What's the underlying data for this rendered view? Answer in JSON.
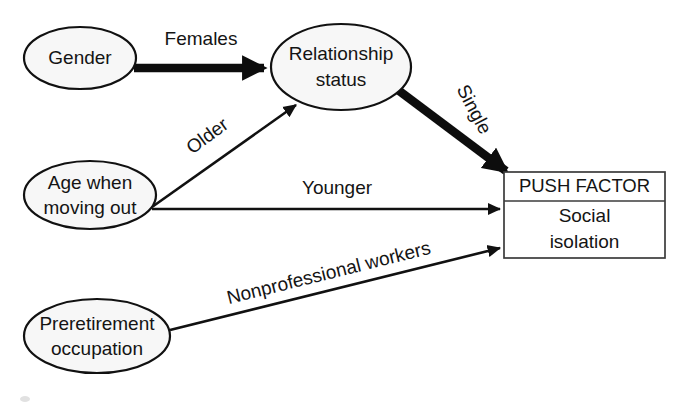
{
  "diagram": {
    "type": "path-diagram",
    "title_visible": false,
    "nodes": [
      {
        "id": "gender",
        "shape": "ellipse",
        "lines": [
          "Gender"
        ],
        "cx": 80,
        "cy": 58,
        "rx": 56,
        "ry": 31
      },
      {
        "id": "relationship-status",
        "shape": "ellipse",
        "lines": [
          "Relationship",
          "status"
        ],
        "cx": 341,
        "cy": 67,
        "rx": 70,
        "ry": 43
      },
      {
        "id": "age-when-moving-out",
        "shape": "ellipse",
        "lines": [
          "Age when",
          "moving out"
        ],
        "cx": 90,
        "cy": 195,
        "rx": 66,
        "ry": 34
      },
      {
        "id": "preretirement-occupation",
        "shape": "ellipse",
        "lines": [
          "Preretirement",
          "occupation"
        ],
        "cx": 97,
        "cy": 336,
        "rx": 73,
        "ry": 37
      }
    ],
    "outcome_box": {
      "id": "push-factor",
      "header": "PUSH FACTOR",
      "body_lines": [
        "Social",
        "isolation"
      ],
      "x": 504,
      "y": 172,
      "width": 161,
      "height": 86,
      "divider_y": 201
    },
    "edges": [
      {
        "id": "gender-to-relationship",
        "from": "gender",
        "to": "relationship-status",
        "label": "Females",
        "weight": "thick",
        "label_rotation": 0
      },
      {
        "id": "age-to-relationship",
        "from": "age-when-moving-out",
        "to": "relationship-status",
        "label": "Older",
        "weight": "thin",
        "label_rotation": -38
      },
      {
        "id": "relationship-to-push",
        "from": "relationship-status",
        "to": "push-factor",
        "label": "Single",
        "weight": "thick",
        "label_rotation": 62
      },
      {
        "id": "age-to-push",
        "from": "age-when-moving-out",
        "to": "push-factor",
        "label": "Younger",
        "weight": "thin",
        "label_rotation": 0
      },
      {
        "id": "preretirement-to-push",
        "from": "preretirement-occupation",
        "to": "push-factor",
        "label": "Nonprofessional workers",
        "weight": "thin",
        "label_rotation": -16
      }
    ],
    "colors": {
      "stroke": "#111111",
      "node_fill": "#f7f7f7",
      "box_fill": "#ffffff",
      "box_stroke": "#3b3b3b",
      "text": "#141414",
      "background": "#ffffff"
    }
  }
}
